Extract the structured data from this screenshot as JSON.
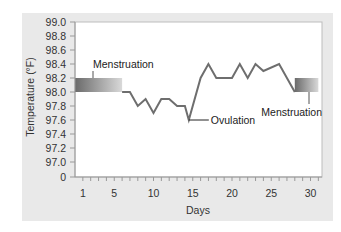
{
  "chart_data": {
    "type": "line",
    "title": "",
    "xlabel": "Days",
    "ylabel": "Temperature (°F)",
    "x_ticks": [
      1,
      5,
      10,
      15,
      20,
      25,
      30
    ],
    "y_ticks": [
      "0",
      "97.0",
      "97.2",
      "97.4",
      "97.6",
      "97.8",
      "98.0",
      "98.2",
      "98.4",
      "98.6",
      "98.8",
      "99.0"
    ],
    "xlim": [
      0,
      31
    ],
    "ylim": [
      97.0,
      99.0
    ],
    "y_axis_break": true,
    "grid": false,
    "series": [
      {
        "name": "Basal body temperature",
        "x": [
          6,
          7,
          8,
          9,
          10,
          11,
          12,
          13,
          14,
          14.5,
          16,
          17,
          18,
          20,
          21,
          22,
          23,
          24,
          26,
          28
        ],
        "values": [
          98.0,
          98.0,
          97.8,
          97.9,
          97.7,
          97.9,
          97.9,
          97.8,
          97.8,
          97.6,
          98.2,
          98.4,
          98.2,
          98.2,
          98.4,
          98.2,
          98.4,
          98.3,
          98.4,
          98.0
        ]
      }
    ],
    "bands": [
      {
        "label": "Menstruation",
        "x_start": 0,
        "x_end": 6,
        "y_low": 98.0,
        "y_high": 98.2
      },
      {
        "label": "Menstruation",
        "x_start": 28,
        "x_end": 31,
        "y_low": 98.0,
        "y_high": 98.2
      }
    ],
    "annotations": [
      {
        "text": "Menstruation",
        "x": 3,
        "y": 98.2,
        "position": "above"
      },
      {
        "text": "Ovulation",
        "x": 14.5,
        "y": 97.6,
        "position": "right"
      },
      {
        "text": "Menstruation",
        "x": 29.5,
        "y": 98.0,
        "position": "below"
      }
    ]
  },
  "colors": {
    "panel_bg": "#e9e9e9",
    "plot_bg": "#ffffff",
    "line": "#6e6e6e",
    "band_dark": "#6a6a6a",
    "band_light": "#d4d4d4",
    "text": "#333333"
  }
}
